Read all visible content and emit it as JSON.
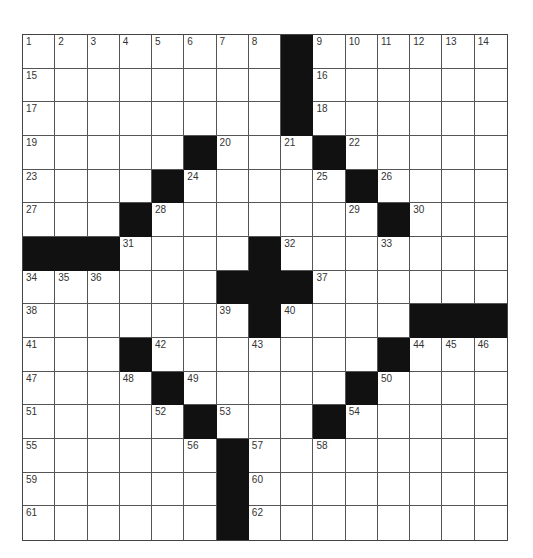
{
  "puzzle": {
    "rows": 15,
    "cols": 15,
    "colors": {
      "block": "#111111",
      "cell": "#ffffff",
      "line": "#555555",
      "number": "#333333"
    },
    "grid": [
      "........#......",
      "........#......",
      "........#......",
      ".....#...#.....",
      "....#.....#....",
      "...#.......#...",
      "###....#.......",
      "......###......",
      ".......#....###",
      "...#.......#...",
      "....#.....#....",
      ".....#...#.....",
      "......#........",
      "......#........",
      "......#........"
    ],
    "numbers": [
      {
        "r": 0,
        "c": 0,
        "n": "1"
      },
      {
        "r": 0,
        "c": 1,
        "n": "2"
      },
      {
        "r": 0,
        "c": 2,
        "n": "3"
      },
      {
        "r": 0,
        "c": 3,
        "n": "4"
      },
      {
        "r": 0,
        "c": 4,
        "n": "5"
      },
      {
        "r": 0,
        "c": 5,
        "n": "6"
      },
      {
        "r": 0,
        "c": 6,
        "n": "7"
      },
      {
        "r": 0,
        "c": 7,
        "n": "8"
      },
      {
        "r": 0,
        "c": 9,
        "n": "9"
      },
      {
        "r": 0,
        "c": 10,
        "n": "10"
      },
      {
        "r": 0,
        "c": 11,
        "n": "11"
      },
      {
        "r": 0,
        "c": 12,
        "n": "12"
      },
      {
        "r": 0,
        "c": 13,
        "n": "13"
      },
      {
        "r": 0,
        "c": 14,
        "n": "14"
      },
      {
        "r": 1,
        "c": 0,
        "n": "15"
      },
      {
        "r": 1,
        "c": 9,
        "n": "16"
      },
      {
        "r": 2,
        "c": 0,
        "n": "17"
      },
      {
        "r": 2,
        "c": 9,
        "n": "18"
      },
      {
        "r": 3,
        "c": 0,
        "n": "19"
      },
      {
        "r": 3,
        "c": 6,
        "n": "20"
      },
      {
        "r": 3,
        "c": 8,
        "n": "21"
      },
      {
        "r": 3,
        "c": 10,
        "n": "22"
      },
      {
        "r": 4,
        "c": 0,
        "n": "23"
      },
      {
        "r": 4,
        "c": 5,
        "n": "24"
      },
      {
        "r": 4,
        "c": 9,
        "n": "25"
      },
      {
        "r": 4,
        "c": 11,
        "n": "26"
      },
      {
        "r": 5,
        "c": 0,
        "n": "27"
      },
      {
        "r": 5,
        "c": 4,
        "n": "28"
      },
      {
        "r": 5,
        "c": 10,
        "n": "29"
      },
      {
        "r": 5,
        "c": 12,
        "n": "30"
      },
      {
        "r": 6,
        "c": 3,
        "n": "31"
      },
      {
        "r": 6,
        "c": 8,
        "n": "32"
      },
      {
        "r": 6,
        "c": 11,
        "n": "33"
      },
      {
        "r": 7,
        "c": 0,
        "n": "34"
      },
      {
        "r": 7,
        "c": 1,
        "n": "35"
      },
      {
        "r": 7,
        "c": 2,
        "n": "36"
      },
      {
        "r": 7,
        "c": 9,
        "n": "37"
      },
      {
        "r": 8,
        "c": 0,
        "n": "38"
      },
      {
        "r": 8,
        "c": 6,
        "n": "39"
      },
      {
        "r": 8,
        "c": 8,
        "n": "40"
      },
      {
        "r": 9,
        "c": 0,
        "n": "41"
      },
      {
        "r": 9,
        "c": 4,
        "n": "42"
      },
      {
        "r": 9,
        "c": 7,
        "n": "43"
      },
      {
        "r": 9,
        "c": 12,
        "n": "44"
      },
      {
        "r": 9,
        "c": 13,
        "n": "45"
      },
      {
        "r": 9,
        "c": 14,
        "n": "46"
      },
      {
        "r": 10,
        "c": 0,
        "n": "47"
      },
      {
        "r": 10,
        "c": 3,
        "n": "48"
      },
      {
        "r": 10,
        "c": 5,
        "n": "49"
      },
      {
        "r": 10,
        "c": 11,
        "n": "50"
      },
      {
        "r": 11,
        "c": 0,
        "n": "51"
      },
      {
        "r": 11,
        "c": 4,
        "n": "52"
      },
      {
        "r": 11,
        "c": 6,
        "n": "53"
      },
      {
        "r": 11,
        "c": 10,
        "n": "54"
      },
      {
        "r": 12,
        "c": 0,
        "n": "55"
      },
      {
        "r": 12,
        "c": 5,
        "n": "56"
      },
      {
        "r": 12,
        "c": 7,
        "n": "57"
      },
      {
        "r": 12,
        "c": 9,
        "n": "58"
      },
      {
        "r": 13,
        "c": 0,
        "n": "59"
      },
      {
        "r": 13,
        "c": 7,
        "n": "60"
      },
      {
        "r": 14,
        "c": 0,
        "n": "61"
      },
      {
        "r": 14,
        "c": 7,
        "n": "62"
      }
    ]
  }
}
